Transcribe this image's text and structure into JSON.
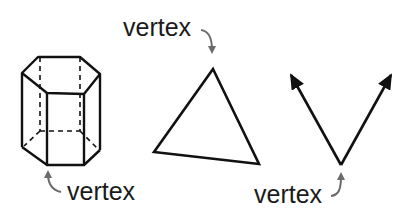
{
  "diagram": {
    "figures": [
      {
        "name": "hexagonal-prism",
        "label": "vertex",
        "label_position": "below"
      },
      {
        "name": "triangle",
        "label": "vertex",
        "label_position": "above"
      },
      {
        "name": "angle-rays",
        "label": "vertex",
        "label_position": "below"
      }
    ],
    "colors": {
      "stroke": "#111111",
      "arrow": "#6b6b6b",
      "text": "#1a1a1a",
      "background": "#ffffff"
    }
  }
}
